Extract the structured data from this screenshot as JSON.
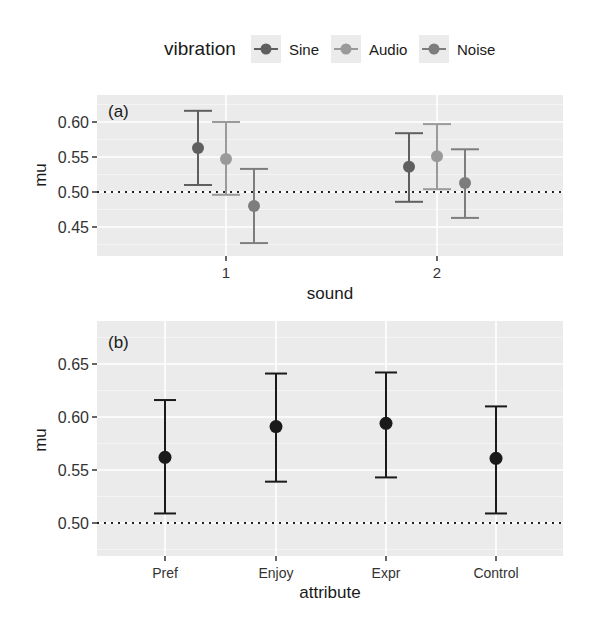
{
  "legend": {
    "title": "vibration",
    "items": [
      {
        "label": "Sine",
        "color": "#5f5f5f"
      },
      {
        "label": "Audio",
        "color": "#9a9a9a"
      },
      {
        "label": "Noise",
        "color": "#7d7d7d"
      }
    ]
  },
  "panel_a": {
    "tag": "(a)",
    "xlabel": "sound",
    "ylabel": "mu",
    "yticks": [
      "0.45",
      "0.50",
      "0.55",
      "0.60"
    ],
    "xticks": [
      "1",
      "2"
    ]
  },
  "panel_b": {
    "tag": "(b)",
    "xlabel": "attribute",
    "ylabel": "mu",
    "yticks": [
      "0.50",
      "0.55",
      "0.60",
      "0.65"
    ],
    "xticks": [
      "Pref",
      "Enjoy",
      "Expr",
      "Control"
    ]
  },
  "chart_data": [
    {
      "type": "scatter",
      "subtype": "pointrange-errorbar",
      "title": "(a)",
      "xlabel": "sound",
      "ylabel": "mu",
      "categories": [
        "1",
        "2"
      ],
      "ylim": [
        0.42,
        0.64
      ],
      "yticks": [
        0.45,
        0.5,
        0.55,
        0.6
      ],
      "reference_line": {
        "y": 0.5,
        "style": "dotted"
      },
      "legend": {
        "title": "vibration",
        "position": "top"
      },
      "grid": true,
      "series": [
        {
          "name": "Sine",
          "color": "#5f5f5f",
          "values": [
            0.563,
            0.536
          ],
          "lower": [
            0.51,
            0.486
          ],
          "upper": [
            0.616,
            0.584
          ]
        },
        {
          "name": "Audio",
          "color": "#9a9a9a",
          "values": [
            0.547,
            0.551
          ],
          "lower": [
            0.496,
            0.504
          ],
          "upper": [
            0.6,
            0.597
          ]
        },
        {
          "name": "Noise",
          "color": "#7d7d7d",
          "values": [
            0.48,
            0.513
          ],
          "lower": [
            0.427,
            0.463
          ],
          "upper": [
            0.533,
            0.561
          ]
        }
      ]
    },
    {
      "type": "scatter",
      "subtype": "pointrange-errorbar",
      "title": "(b)",
      "xlabel": "attribute",
      "ylabel": "mu",
      "categories": [
        "Pref",
        "Enjoy",
        "Expr",
        "Control"
      ],
      "ylim": [
        0.469,
        0.69
      ],
      "yticks": [
        0.5,
        0.55,
        0.6,
        0.65
      ],
      "reference_line": {
        "y": 0.5,
        "style": "dotted"
      },
      "grid": true,
      "series": [
        {
          "name": "mu",
          "color": "#1a1a1a",
          "values": [
            0.562,
            0.591,
            0.594,
            0.561
          ],
          "lower": [
            0.509,
            0.539,
            0.543,
            0.509
          ],
          "upper": [
            0.616,
            0.641,
            0.642,
            0.61
          ]
        }
      ]
    }
  ]
}
